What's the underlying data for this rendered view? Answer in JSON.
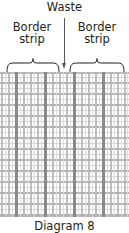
{
  "figure": {
    "caption": "Diagram 8",
    "waste_label": "Waste",
    "border_left": {
      "line1": "Border",
      "line2": "strip"
    },
    "border_right": {
      "line1": "Border",
      "line2": "strip"
    },
    "colors": {
      "text": "#231f20",
      "pointer": "#58595b",
      "brace": "#231f20",
      "grid_light": "#d8d8d8",
      "grid_medium": "#b5b5b5",
      "grid_dark": "#8a8a8a",
      "background": "#ffffff"
    }
  },
  "chart_data": {
    "type": "diagram",
    "title": "Diagram 8",
    "annotations": [
      {
        "text": "Waste",
        "role": "pointer-label",
        "points_to_x": 64
      },
      {
        "text": "Border strip",
        "role": "brace-label",
        "span_x": [
          6,
          60
        ]
      },
      {
        "text": "Border strip",
        "role": "brace-label",
        "span_x": [
          69,
          125
        ]
      }
    ],
    "grid": {
      "x_range": [
        0,
        129
      ],
      "y_range": [
        72,
        217
      ],
      "vertical_lines": [
        {
          "x": 1,
          "w": 2,
          "tone": "medium"
        },
        {
          "x": 5,
          "w": 1,
          "tone": "light"
        },
        {
          "x": 8,
          "w": 2,
          "tone": "medium"
        },
        {
          "x": 12,
          "w": 1,
          "tone": "light"
        },
        {
          "x": 15,
          "w": 3,
          "tone": "dark"
        },
        {
          "x": 20,
          "w": 1,
          "tone": "light"
        },
        {
          "x": 23,
          "w": 2,
          "tone": "medium"
        },
        {
          "x": 27,
          "w": 1,
          "tone": "light"
        },
        {
          "x": 30,
          "w": 2,
          "tone": "medium"
        },
        {
          "x": 34,
          "w": 1,
          "tone": "light"
        },
        {
          "x": 37,
          "w": 2,
          "tone": "medium"
        },
        {
          "x": 41,
          "w": 1,
          "tone": "light"
        },
        {
          "x": 44,
          "w": 3,
          "tone": "dark"
        },
        {
          "x": 49,
          "w": 1,
          "tone": "light"
        },
        {
          "x": 52,
          "w": 2,
          "tone": "medium"
        },
        {
          "x": 56,
          "w": 1,
          "tone": "light"
        },
        {
          "x": 59,
          "w": 2,
          "tone": "medium"
        },
        {
          "x": 63,
          "w": 1,
          "tone": "light"
        },
        {
          "x": 66,
          "w": 2,
          "tone": "medium"
        },
        {
          "x": 70,
          "w": 1,
          "tone": "light"
        },
        {
          "x": 73,
          "w": 3,
          "tone": "dark"
        },
        {
          "x": 78,
          "w": 1,
          "tone": "light"
        },
        {
          "x": 81,
          "w": 2,
          "tone": "medium"
        },
        {
          "x": 85,
          "w": 1,
          "tone": "light"
        },
        {
          "x": 88,
          "w": 2,
          "tone": "medium"
        },
        {
          "x": 92,
          "w": 1,
          "tone": "light"
        },
        {
          "x": 95,
          "w": 2,
          "tone": "medium"
        },
        {
          "x": 99,
          "w": 1,
          "tone": "light"
        },
        {
          "x": 102,
          "w": 3,
          "tone": "dark"
        },
        {
          "x": 107,
          "w": 1,
          "tone": "light"
        },
        {
          "x": 110,
          "w": 2,
          "tone": "medium"
        },
        {
          "x": 114,
          "w": 1,
          "tone": "light"
        },
        {
          "x": 117,
          "w": 2,
          "tone": "medium"
        },
        {
          "x": 121,
          "w": 1,
          "tone": "light"
        },
        {
          "x": 124,
          "w": 2,
          "tone": "medium"
        },
        {
          "x": 127,
          "w": 1,
          "tone": "light"
        }
      ],
      "horizontal_lines": [
        {
          "y": 0,
          "h": 2,
          "tone": "medium"
        },
        {
          "y": 5,
          "h": 1,
          "tone": "light"
        },
        {
          "y": 10,
          "h": 2,
          "tone": "medium"
        },
        {
          "y": 16,
          "h": 1,
          "tone": "light"
        },
        {
          "y": 21,
          "h": 2,
          "tone": "medium"
        },
        {
          "y": 27,
          "h": 1,
          "tone": "light"
        },
        {
          "y": 32,
          "h": 2,
          "tone": "medium"
        },
        {
          "y": 38,
          "h": 1,
          "tone": "light"
        },
        {
          "y": 43,
          "h": 2,
          "tone": "medium"
        },
        {
          "y": 49,
          "h": 1,
          "tone": "light"
        },
        {
          "y": 54,
          "h": 2,
          "tone": "medium"
        },
        {
          "y": 60,
          "h": 1,
          "tone": "light"
        },
        {
          "y": 65,
          "h": 2,
          "tone": "medium"
        },
        {
          "y": 71,
          "h": 1,
          "tone": "light"
        },
        {
          "y": 76,
          "h": 2,
          "tone": "medium"
        },
        {
          "y": 82,
          "h": 1,
          "tone": "light"
        },
        {
          "y": 87,
          "h": 2,
          "tone": "medium"
        },
        {
          "y": 93,
          "h": 1,
          "tone": "light"
        },
        {
          "y": 98,
          "h": 2,
          "tone": "medium"
        },
        {
          "y": 104,
          "h": 1,
          "tone": "light"
        },
        {
          "y": 109,
          "h": 2,
          "tone": "medium"
        },
        {
          "y": 115,
          "h": 1,
          "tone": "light"
        },
        {
          "y": 120,
          "h": 2,
          "tone": "medium"
        },
        {
          "y": 126,
          "h": 1,
          "tone": "light"
        },
        {
          "y": 131,
          "h": 2,
          "tone": "medium"
        },
        {
          "y": 137,
          "h": 1,
          "tone": "light"
        },
        {
          "y": 142,
          "h": 3,
          "tone": "medium"
        }
      ]
    }
  }
}
